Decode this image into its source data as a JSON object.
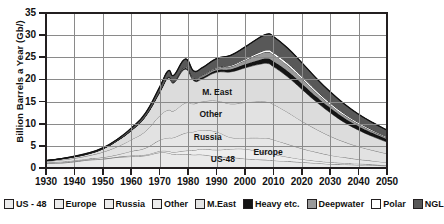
{
  "chart_data": {
    "type": "area",
    "title": "",
    "subtitle": "",
    "xlabel": "",
    "ylabel": "Billion Barrels a Year (Gb/)",
    "xlim": [
      1930,
      2050
    ],
    "ylim": [
      0,
      35
    ],
    "grid": true,
    "stacked": true,
    "legend_position": "below",
    "x_ticks": [
      1930,
      1940,
      1950,
      1960,
      1970,
      1980,
      1990,
      2000,
      2010,
      2020,
      2030,
      2040,
      2050
    ],
    "y_ticks": [
      0,
      5,
      10,
      15,
      20,
      25,
      30,
      35
    ],
    "x": [
      1930,
      1935,
      1940,
      1945,
      1950,
      1955,
      1960,
      1965,
      1970,
      1973,
      1975,
      1979,
      1982,
      1985,
      1990,
      1995,
      2000,
      2005,
      2008,
      2010,
      2015,
      2020,
      2025,
      2030,
      2035,
      2040,
      2045,
      2050
    ],
    "series": [
      {
        "name": "US - 48",
        "color": "#e9e9e9",
        "values": [
          1.0,
          1.1,
          1.4,
          1.8,
          2.0,
          2.4,
          2.6,
          2.8,
          3.5,
          3.4,
          3.1,
          3.1,
          3.0,
          3.0,
          2.6,
          2.4,
          2.1,
          1.9,
          1.8,
          1.7,
          1.5,
          1.3,
          1.1,
          0.9,
          0.8,
          0.7,
          0.6,
          0.5
        ]
      },
      {
        "name": "Europe",
        "color": "#ededed",
        "values": [
          0.1,
          0.1,
          0.1,
          0.1,
          0.1,
          0.1,
          0.2,
          0.2,
          0.3,
          0.4,
          0.5,
          0.8,
          1.0,
          1.3,
          1.5,
          1.9,
          2.2,
          1.8,
          1.5,
          1.4,
          1.0,
          0.7,
          0.5,
          0.4,
          0.3,
          0.25,
          0.2,
          0.15
        ]
      },
      {
        "name": "Russia",
        "color": "#e6e6e6",
        "values": [
          0.1,
          0.2,
          0.2,
          0.2,
          0.3,
          0.5,
          1.0,
          1.5,
          2.5,
          3.0,
          3.3,
          4.0,
          4.2,
          4.3,
          4.1,
          2.6,
          2.5,
          3.1,
          3.4,
          3.3,
          2.9,
          2.4,
          2.0,
          1.6,
          1.3,
          1.0,
          0.8,
          0.6
        ]
      },
      {
        "name": "Other",
        "color": "#e2e2e2",
        "values": [
          0.3,
          0.4,
          0.5,
          0.7,
          1.2,
          1.8,
          2.6,
          3.8,
          5.5,
          6.3,
          6.0,
          6.8,
          6.3,
          6.4,
          7.0,
          7.6,
          8.0,
          8.2,
          8.2,
          8.0,
          7.2,
          6.2,
          5.2,
          4.3,
          3.5,
          2.9,
          2.4,
          2.0
        ]
      },
      {
        "name": "M.East",
        "color": "#dcdcdc",
        "values": [
          0.1,
          0.2,
          0.3,
          0.4,
          0.7,
          1.3,
          2.0,
          3.3,
          5.2,
          7.2,
          6.3,
          7.6,
          5.2,
          5.1,
          6.4,
          7.2,
          7.8,
          8.4,
          8.7,
          8.5,
          8.0,
          7.2,
          6.2,
          5.3,
          4.4,
          3.7,
          3.1,
          2.6
        ]
      },
      {
        "name": "Heavy etc.",
        "color": "#141414",
        "values": [
          0.05,
          0.05,
          0.05,
          0.05,
          0.05,
          0.05,
          0.1,
          0.1,
          0.2,
          0.2,
          0.2,
          0.3,
          0.3,
          0.4,
          0.5,
          0.6,
          0.8,
          1.0,
          1.1,
          1.2,
          1.3,
          1.3,
          1.2,
          1.1,
          1.0,
          0.9,
          0.8,
          0.7
        ]
      },
      {
        "name": "Deepwater",
        "color": "#9a9a9a",
        "values": [
          0.0,
          0.0,
          0.0,
          0.0,
          0.0,
          0.0,
          0.0,
          0.0,
          0.0,
          0.05,
          0.1,
          0.2,
          0.2,
          0.3,
          0.4,
          0.6,
          0.9,
          1.3,
          1.5,
          1.5,
          1.3,
          1.1,
          0.9,
          0.7,
          0.6,
          0.5,
          0.4,
          0.3
        ]
      },
      {
        "name": "Polar",
        "color": "#ffffff",
        "values": [
          0.0,
          0.0,
          0.0,
          0.0,
          0.0,
          0.0,
          0.0,
          0.0,
          0.0,
          0.0,
          0.05,
          0.1,
          0.1,
          0.15,
          0.2,
          0.25,
          0.3,
          0.4,
          0.45,
          0.5,
          0.5,
          0.5,
          0.45,
          0.4,
          0.35,
          0.3,
          0.25,
          0.2
        ]
      },
      {
        "name": "NGL",
        "color": "#585858",
        "values": [
          0.05,
          0.05,
          0.1,
          0.15,
          0.2,
          0.3,
          0.5,
          0.7,
          1.1,
          1.4,
          1.4,
          1.7,
          1.6,
          1.7,
          2.0,
          2.3,
          2.7,
          3.3,
          3.6,
          3.6,
          3.4,
          3.1,
          2.8,
          2.5,
          2.2,
          1.9,
          1.7,
          1.5
        ]
      }
    ],
    "totals": [
      1.7,
      2.05,
      2.65,
      3.4,
      4.55,
      6.45,
      9.0,
      12.4,
      18.3,
      21.95,
      20.95,
      24.6,
      21.9,
      22.65,
      24.7,
      25.45,
      27.3,
      29.4,
      30.25,
      29.7,
      27.1,
      23.8,
      20.35,
      17.2,
      14.45,
      12.15,
      10.25,
      8.55
    ],
    "annotations": [
      {
        "text": "M. East",
        "x": 1985,
        "y": 17.0
      },
      {
        "text": "Other",
        "x": 1984,
        "y": 12.0
      },
      {
        "text": "Russia",
        "x": 1982,
        "y": 6.8
      },
      {
        "text": "Europe",
        "x": 2003,
        "y": 3.3
      },
      {
        "text": "US-48",
        "x": 1988,
        "y": 1.8
      }
    ]
  },
  "legend": {
    "items": [
      {
        "label": "US - 48",
        "color": "#ececec"
      },
      {
        "label": "Europe",
        "color": "#ececec"
      },
      {
        "label": "Russia",
        "color": "#ececec"
      },
      {
        "label": "Other",
        "color": "#ececec"
      },
      {
        "label": "M.East",
        "color": "#e4e4e4"
      },
      {
        "label": "Heavy etc.",
        "color": "#141414"
      },
      {
        "label": "Deepwater",
        "color": "#9a9a9a"
      },
      {
        "label": "Polar",
        "color": "#ffffff"
      },
      {
        "label": "NGL",
        "color": "#585858"
      }
    ]
  }
}
